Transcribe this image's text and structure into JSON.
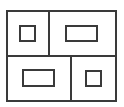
{
  "diagram": {
    "title": "",
    "stroke_color": "#3a3a3a",
    "background_color": "#ffffff",
    "cells": [
      {
        "name": "top-left-cell",
        "inner_shape": "square"
      },
      {
        "name": "top-right-cell",
        "inner_shape": "wide-rectangle"
      },
      {
        "name": "bottom-left-cell",
        "inner_shape": "wide-rectangle"
      },
      {
        "name": "bottom-right-cell",
        "inner_shape": "square"
      }
    ]
  }
}
